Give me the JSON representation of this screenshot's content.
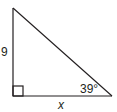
{
  "diagram": {
    "type": "right-triangle",
    "stroke_color": "#231f20",
    "background": "#ffffff",
    "vertices": {
      "top": [
        13,
        8
      ],
      "right_angle": [
        13,
        96
      ],
      "bottom_right": [
        112,
        96
      ]
    },
    "right_angle_marker": {
      "x": 13,
      "y": 86,
      "size": 10
    },
    "labels": {
      "vertical_side": "9",
      "horizontal_side": "x",
      "angle": "39°"
    }
  }
}
